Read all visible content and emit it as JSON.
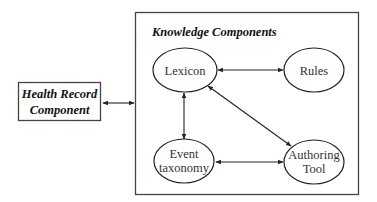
{
  "diagram": {
    "health_record": {
      "line1": "Health Record",
      "line2": "Component"
    },
    "knowledge_container": {
      "title": "Knowledge Components"
    },
    "nodes": {
      "lexicon": {
        "label": "Lexicon"
      },
      "rules": {
        "label": "Rules"
      },
      "event_taxonomy": {
        "line1": "Event",
        "line2": "taxonomy"
      },
      "authoring_tool": {
        "line1": "Authoring",
        "line2": "Tool"
      }
    },
    "edges": [
      {
        "from": "Health Record Component",
        "to": "Knowledge Components",
        "type": "bidirectional"
      },
      {
        "from": "Lexicon",
        "to": "Rules",
        "type": "bidirectional"
      },
      {
        "from": "Lexicon",
        "to": "Event taxonomy",
        "type": "bidirectional"
      },
      {
        "from": "Lexicon",
        "to": "Authoring Tool",
        "type": "bidirectional"
      },
      {
        "from": "Event taxonomy",
        "to": "Authoring Tool",
        "type": "bidirectional"
      }
    ],
    "colors": {
      "stroke": "#222222",
      "text": "#333333",
      "background": "#ffffff"
    }
  }
}
